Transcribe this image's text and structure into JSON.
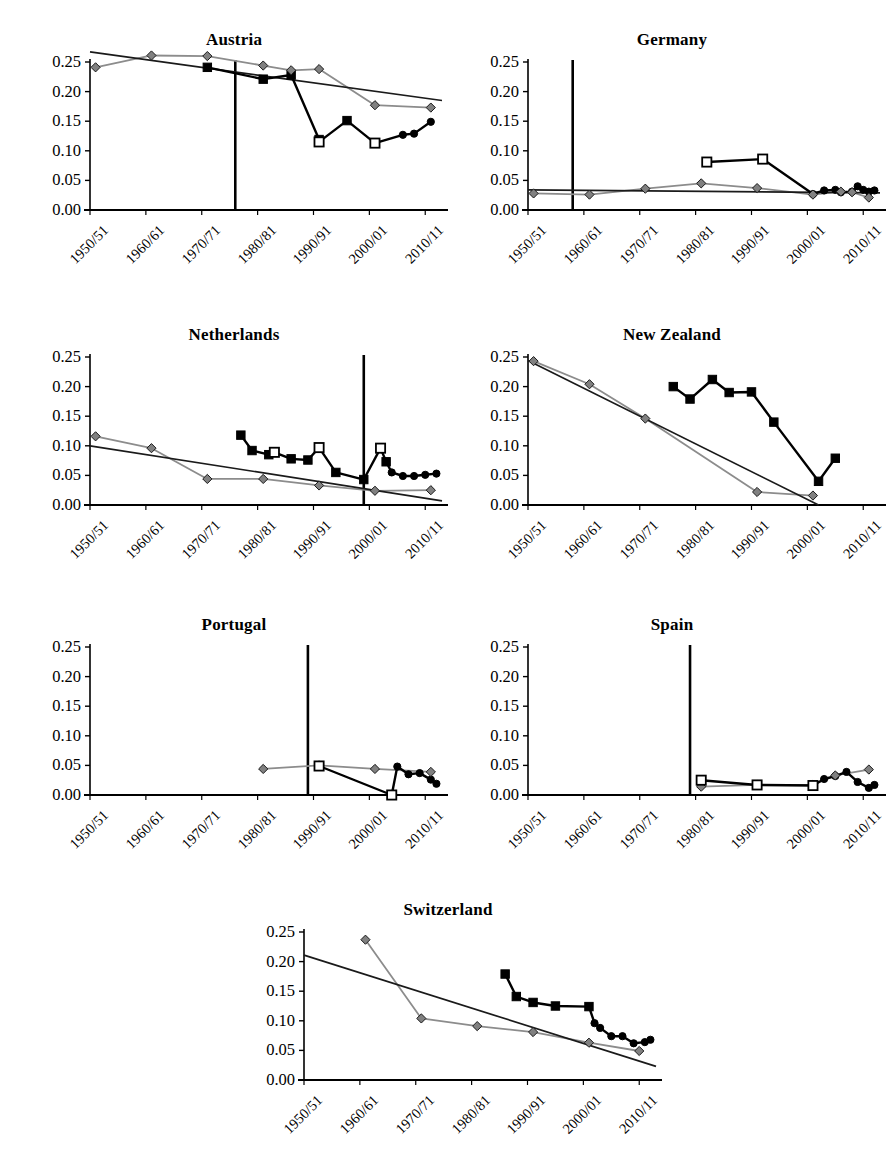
{
  "figure": {
    "panel_order": [
      "austria",
      "germany",
      "netherlands",
      "new_zealand",
      "portugal",
      "spain",
      "switzerland"
    ],
    "y_ticks": [
      "0.00",
      "0.05",
      "0.10",
      "0.15",
      "0.20",
      "0.25"
    ],
    "x_ticks": [
      "1950/51",
      "1960/61",
      "1970/71",
      "1980/81",
      "1990/91",
      "2000/01",
      "2010/11"
    ],
    "colors": {
      "axis": "#000000",
      "series_census": "#8c8c8c",
      "series_survey": "#000000",
      "trend": "#1a1a1a",
      "marker_diamond_fill": "#808080",
      "marker_square_fill": "#000000",
      "marker_square_open_fill": "#ffffff",
      "marker_circle_fill": "#000000",
      "reference_line": "#000000"
    }
  },
  "chart_data": [
    {
      "type": "line",
      "title": "Austria",
      "xlabel": "",
      "ylabel": "",
      "ylim": [
        0.0,
        0.25
      ],
      "xlim": [
        1950,
        2013
      ],
      "grid": false,
      "legend": "none",
      "xtick_labels": [
        "1950/51",
        "1960/61",
        "1970/71",
        "1980/81",
        "1990/91",
        "2000/01",
        "2010/11"
      ],
      "xtick_values": [
        1950,
        1960,
        1970,
        1980,
        1990,
        2000,
        2010
      ],
      "ytick_labels": [
        "0.00",
        "0.05",
        "0.10",
        "0.15",
        "0.20",
        "0.25"
      ],
      "reference_line_x": 1976,
      "series": [
        {
          "name": "census-diamond",
          "marker": "diamond",
          "color": "#8c8c8c",
          "x": [
            1951,
            1961,
            1971,
            1981,
            1986,
            1991,
            2001,
            2011
          ],
          "y": [
            0.241,
            0.261,
            0.26,
            0.244,
            0.236,
            0.238,
            0.177,
            0.173
          ]
        },
        {
          "name": "survey-square-filled",
          "marker": "square-filled",
          "color": "#000000",
          "x": [
            1971,
            1981,
            1986,
            1991,
            1996
          ],
          "y": [
            0.241,
            0.221,
            0.228,
            0.119,
            0.151
          ]
        },
        {
          "name": "survey-square-open",
          "marker": "square-open",
          "color": "#000000",
          "x": [
            1991,
            2001
          ],
          "y": [
            0.115,
            0.113
          ]
        },
        {
          "name": "survey-circle",
          "marker": "circle",
          "color": "#000000",
          "x": [
            2001,
            2006,
            2008,
            2011
          ],
          "y": [
            0.113,
            0.127,
            0.129,
            0.149
          ]
        },
        {
          "name": "trend",
          "marker": "none",
          "color": "#1a1a1a",
          "x": [
            1950,
            2013
          ],
          "y": [
            0.267,
            0.185
          ]
        }
      ]
    },
    {
      "type": "line",
      "title": "Germany",
      "xlabel": "",
      "ylabel": "",
      "ylim": [
        0.0,
        0.25
      ],
      "xlim": [
        1950,
        2013
      ],
      "grid": false,
      "legend": "none",
      "xtick_labels": [
        "1950/51",
        "1960/61",
        "1970/71",
        "1980/81",
        "1990/91",
        "2000/01",
        "2010/11"
      ],
      "xtick_values": [
        1950,
        1960,
        1970,
        1980,
        1990,
        2000,
        2010
      ],
      "ytick_labels": [
        "0.00",
        "0.05",
        "0.10",
        "0.15",
        "0.20",
        "0.25"
      ],
      "reference_line_x": 1958,
      "series": [
        {
          "name": "census-diamond",
          "marker": "diamond",
          "color": "#8c8c8c",
          "x": [
            1951,
            1961,
            1971,
            1981,
            1991,
            2001,
            2006,
            2008,
            2011
          ],
          "y": [
            0.028,
            0.026,
            0.036,
            0.045,
            0.037,
            0.026,
            0.031,
            0.03,
            0.021
          ]
        },
        {
          "name": "survey-square-open",
          "marker": "square-open",
          "color": "#000000",
          "x": [
            1982,
            1992
          ],
          "y": [
            0.081,
            0.086
          ]
        },
        {
          "name": "survey-circle",
          "marker": "circle",
          "color": "#000000",
          "x": [
            2001,
            2003,
            2005,
            2006,
            2008,
            2009,
            2010,
            2011,
            2012
          ],
          "y": [
            0.027,
            0.033,
            0.034,
            0.03,
            0.031,
            0.04,
            0.034,
            0.031,
            0.033
          ]
        },
        {
          "name": "trend",
          "marker": "none",
          "color": "#1a1a1a",
          "x": [
            1950,
            2013
          ],
          "y": [
            0.034,
            0.029
          ]
        }
      ]
    },
    {
      "type": "line",
      "title": "Netherlands",
      "xlabel": "",
      "ylabel": "",
      "ylim": [
        0.0,
        0.25
      ],
      "xlim": [
        1950,
        2013
      ],
      "grid": false,
      "legend": "none",
      "xtick_labels": [
        "1950/51",
        "1960/61",
        "1970/71",
        "1980/81",
        "1990/91",
        "2000/01",
        "2010/11"
      ],
      "xtick_values": [
        1950,
        1960,
        1970,
        1980,
        1990,
        2000,
        2010
      ],
      "ytick_labels": [
        "0.00",
        "0.05",
        "0.10",
        "0.15",
        "0.20",
        "0.25"
      ],
      "reference_line_x": 1999,
      "series": [
        {
          "name": "census-diamond",
          "marker": "diamond",
          "color": "#8c8c8c",
          "x": [
            1951,
            1961,
            1971,
            1981,
            1991,
            2001,
            2011
          ],
          "y": [
            0.116,
            0.096,
            0.044,
            0.044,
            0.033,
            0.024,
            0.025
          ]
        },
        {
          "name": "survey-square-filled",
          "marker": "square-filled",
          "color": "#000000",
          "x": [
            1977,
            1979,
            1982,
            1986,
            1989,
            1994,
            1999,
            2003
          ],
          "y": [
            0.118,
            0.092,
            0.085,
            0.078,
            0.076,
            0.055,
            0.043,
            0.073
          ]
        },
        {
          "name": "survey-square-open",
          "marker": "square-open",
          "color": "#000000",
          "x": [
            1983,
            1991,
            2002
          ],
          "y": [
            0.089,
            0.097,
            0.096
          ]
        },
        {
          "name": "survey-circle",
          "marker": "circle",
          "color": "#000000",
          "x": [
            2004,
            2006,
            2008,
            2010,
            2012
          ],
          "y": [
            0.055,
            0.049,
            0.049,
            0.051,
            0.053
          ]
        },
        {
          "name": "trend",
          "marker": "none",
          "color": "#1a1a1a",
          "x": [
            1950,
            2013
          ],
          "y": [
            0.1,
            0.007
          ]
        }
      ]
    },
    {
      "type": "line",
      "title": "New Zealand",
      "xlabel": "",
      "ylabel": "",
      "ylim": [
        0.0,
        0.25
      ],
      "xlim": [
        1950,
        2013
      ],
      "grid": false,
      "legend": "none",
      "xtick_labels": [
        "1950/51",
        "1960/61",
        "1970/71",
        "1980/81",
        "1990/91",
        "2000/01",
        "2010/11"
      ],
      "xtick_values": [
        1950,
        1960,
        1970,
        1980,
        1990,
        2000,
        2010
      ],
      "ytick_labels": [
        "0.00",
        "0.05",
        "0.10",
        "0.15",
        "0.20",
        "0.25"
      ],
      "reference_line_x": null,
      "series": [
        {
          "name": "census-diamond",
          "marker": "diamond",
          "color": "#8c8c8c",
          "x": [
            1951,
            1961,
            1971,
            1991,
            2001
          ],
          "y": [
            0.243,
            0.204,
            0.146,
            0.022,
            0.016
          ]
        },
        {
          "name": "survey-square-filled",
          "marker": "square-filled",
          "color": "#000000",
          "x": [
            1976,
            1979,
            1983,
            1986,
            1990,
            1994,
            2002,
            2005
          ],
          "y": [
            0.2,
            0.179,
            0.212,
            0.19,
            0.191,
            0.14,
            0.04,
            0.079
          ]
        },
        {
          "name": "trend",
          "marker": "none",
          "color": "#1a1a1a",
          "x": [
            1950,
            2002
          ],
          "y": [
            0.244,
            0.0
          ]
        }
      ]
    },
    {
      "type": "line",
      "title": "Portugal",
      "xlabel": "",
      "ylabel": "",
      "ylim": [
        0.0,
        0.25
      ],
      "xlim": [
        1950,
        2013
      ],
      "grid": false,
      "legend": "none",
      "xtick_labels": [
        "1950/51",
        "1960/61",
        "1970/71",
        "1980/81",
        "1990/91",
        "2000/01",
        "2010/11"
      ],
      "xtick_values": [
        1950,
        1960,
        1970,
        1980,
        1990,
        2000,
        2010
      ],
      "ytick_labels": [
        "0.00",
        "0.05",
        "0.10",
        "0.15",
        "0.20",
        "0.25"
      ],
      "reference_line_x": 1989,
      "series": [
        {
          "name": "census-diamond",
          "marker": "diamond",
          "color": "#8c8c8c",
          "x": [
            1981,
            1991,
            2001,
            2011
          ],
          "y": [
            0.044,
            0.05,
            0.044,
            0.039
          ]
        },
        {
          "name": "survey-square-open",
          "marker": "square-open",
          "color": "#000000",
          "x": [
            1991,
            2004
          ],
          "y": [
            0.049,
            0.0
          ]
        },
        {
          "name": "survey-circle",
          "marker": "circle",
          "color": "#000000",
          "x": [
            2005,
            2007,
            2009,
            2011,
            2012
          ],
          "y": [
            0.048,
            0.035,
            0.037,
            0.026,
            0.019
          ]
        },
        {
          "name": "trend",
          "marker": "none",
          "color": "#1a1a1a",
          "x": [],
          "y": []
        }
      ]
    },
    {
      "type": "line",
      "title": "Spain",
      "xlabel": "",
      "ylabel": "",
      "ylim": [
        0.0,
        0.25
      ],
      "xlim": [
        1950,
        2013
      ],
      "grid": false,
      "legend": "none",
      "xtick_labels": [
        "1950/51",
        "1960/61",
        "1970/71",
        "1980/81",
        "1990/91",
        "2000/01",
        "2010/11"
      ],
      "xtick_values": [
        1950,
        1960,
        1970,
        1980,
        1990,
        2000,
        2010
      ],
      "ytick_labels": [
        "0.00",
        "0.05",
        "0.10",
        "0.15",
        "0.20",
        "0.25"
      ],
      "reference_line_x": 1979,
      "series": [
        {
          "name": "census-diamond",
          "marker": "diamond",
          "color": "#8c8c8c",
          "x": [
            1981,
            1991,
            2001,
            2005,
            2011
          ],
          "y": [
            0.014,
            0.017,
            0.017,
            0.033,
            0.043
          ]
        },
        {
          "name": "survey-square-open",
          "marker": "square-open",
          "color": "#000000",
          "x": [
            1981,
            1991,
            2001
          ],
          "y": [
            0.025,
            0.017,
            0.016
          ]
        },
        {
          "name": "survey-circle",
          "marker": "circle",
          "color": "#000000",
          "x": [
            2003,
            2005,
            2007,
            2009,
            2011,
            2012
          ],
          "y": [
            0.027,
            0.032,
            0.039,
            0.022,
            0.012,
            0.017
          ]
        },
        {
          "name": "trend",
          "marker": "none",
          "color": "#1a1a1a",
          "x": [],
          "y": []
        }
      ]
    },
    {
      "type": "line",
      "title": "Switzerland",
      "xlabel": "",
      "ylabel": "",
      "ylim": [
        0.0,
        0.25
      ],
      "xlim": [
        1950,
        2013
      ],
      "grid": false,
      "legend": "none",
      "xtick_labels": [
        "1950/51",
        "1960/61",
        "1970/71",
        "1980/81",
        "1990/91",
        "2000/01",
        "2010/11"
      ],
      "xtick_values": [
        1950,
        1960,
        1970,
        1980,
        1990,
        2000,
        2010
      ],
      "ytick_labels": [
        "0.00",
        "0.05",
        "0.10",
        "0.15",
        "0.20",
        "0.25"
      ],
      "reference_line_x": null,
      "series": [
        {
          "name": "census-diamond",
          "marker": "diamond",
          "color": "#8c8c8c",
          "x": [
            1961,
            1971,
            1981,
            1991,
            2001,
            2010
          ],
          "y": [
            0.237,
            0.104,
            0.091,
            0.081,
            0.063,
            0.049
          ]
        },
        {
          "name": "survey-square-filled",
          "marker": "square-filled",
          "color": "#000000",
          "x": [
            1986,
            1988,
            1991,
            1995,
            2001
          ],
          "y": [
            0.179,
            0.141,
            0.131,
            0.125,
            0.124
          ]
        },
        {
          "name": "survey-circle",
          "marker": "circle",
          "color": "#000000",
          "x": [
            2002,
            2003,
            2005,
            2007,
            2009,
            2011,
            2012
          ],
          "y": [
            0.096,
            0.088,
            0.074,
            0.074,
            0.062,
            0.064,
            0.068
          ]
        },
        {
          "name": "trend",
          "marker": "none",
          "color": "#1a1a1a",
          "x": [
            1950,
            2013
          ],
          "y": [
            0.211,
            0.023
          ]
        }
      ]
    }
  ],
  "panel_layout": {
    "austria": {
      "left": 18,
      "top": 30,
      "width": 432,
      "height": 290
    },
    "germany": {
      "left": 456,
      "top": 30,
      "width": 432,
      "height": 290
    },
    "netherlands": {
      "left": 18,
      "top": 325,
      "width": 432,
      "height": 290
    },
    "new_zealand": {
      "left": 456,
      "top": 325,
      "width": 432,
      "height": 290
    },
    "portugal": {
      "left": 18,
      "top": 615,
      "width": 432,
      "height": 290
    },
    "spain": {
      "left": 456,
      "top": 615,
      "width": 432,
      "height": 290
    },
    "switzerland": {
      "left": 232,
      "top": 900,
      "width": 432,
      "height": 266
    }
  }
}
